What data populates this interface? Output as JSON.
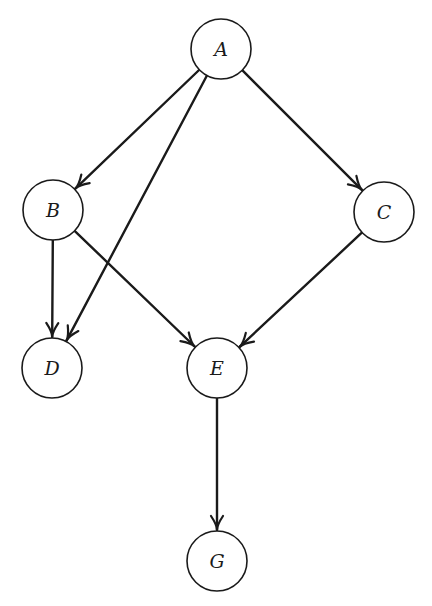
{
  "diagram": {
    "type": "directed-acyclic-graph",
    "node_radius": 30,
    "stroke_color": "#1a1a1a",
    "background": "#ffffff",
    "nodes": [
      {
        "id": "A",
        "label": "A",
        "x": 221,
        "y": 49
      },
      {
        "id": "B",
        "label": "B",
        "x": 53,
        "y": 210
      },
      {
        "id": "C",
        "label": "C",
        "x": 384,
        "y": 212
      },
      {
        "id": "D",
        "label": "D",
        "x": 52,
        "y": 368
      },
      {
        "id": "E",
        "label": "E",
        "x": 217,
        "y": 368
      },
      {
        "id": "G",
        "label": "G",
        "x": 217,
        "y": 561
      }
    ],
    "edges": [
      {
        "from": "A",
        "to": "B"
      },
      {
        "from": "A",
        "to": "C"
      },
      {
        "from": "A",
        "to": "D"
      },
      {
        "from": "B",
        "to": "D"
      },
      {
        "from": "B",
        "to": "E"
      },
      {
        "from": "C",
        "to": "E"
      },
      {
        "from": "E",
        "to": "G"
      }
    ]
  }
}
